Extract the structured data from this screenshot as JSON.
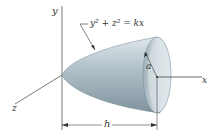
{
  "diagram": {
    "type": "3d-solid-paraboloid",
    "equation": "y² + z² = kx",
    "axes": {
      "x": "x",
      "y": "y",
      "z": "z"
    },
    "radius_label": "a",
    "length_label": "h",
    "colors": {
      "solid_fill": "#b9c7cf",
      "solid_shade": "#8ea2ad",
      "rim_fill": "#cfd9de",
      "line": "#444444"
    }
  }
}
